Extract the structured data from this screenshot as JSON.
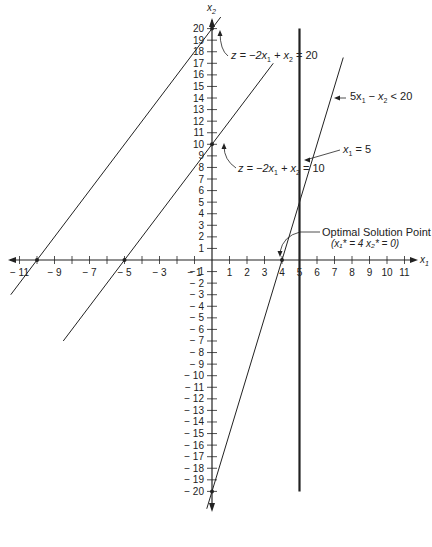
{
  "chart_data": {
    "type": "line",
    "title": "",
    "xlabel": "x1",
    "ylabel": "x2",
    "xlim": [
      -11.5,
      11.5
    ],
    "ylim": [
      -21,
      21
    ],
    "grid": false,
    "x_tick_labels": [
      "-11",
      "-9",
      "-7",
      "-5",
      "-3",
      "-1",
      "1",
      "2",
      "3",
      "4",
      "5",
      "6",
      "7",
      "8",
      "9",
      "10",
      "11"
    ],
    "y_tick_labels": [
      "20",
      "19",
      "18",
      "17",
      "16",
      "15",
      "14",
      "13",
      "12",
      "11",
      "10",
      "9",
      "8",
      "7",
      "6",
      "5",
      "4",
      "3",
      "2",
      "1",
      "-1",
      "-2",
      "-3",
      "-4",
      "-5",
      "-6",
      "-7",
      "-8",
      "-9",
      "-10",
      "-11",
      "-12",
      "-13",
      "-14",
      "-15",
      "-16",
      "-17",
      "-18",
      "-19",
      "-20"
    ],
    "series": [
      {
        "name": "z = -2x1 + x2 = 20",
        "equation": "x2 = 2x1 + 20",
        "x": [
          -11.5,
          0.5
        ],
        "y": [
          -3,
          21
        ],
        "marked_points": [
          [
            -10,
            0
          ],
          [
            0,
            20
          ]
        ]
      },
      {
        "name": "z = -2x1 + x2 = 10",
        "equation": "x2 = 2x1 + 10",
        "x": [
          -8.5,
          3.5
        ],
        "y": [
          -7,
          17
        ],
        "marked_points": [
          [
            -5,
            0
          ],
          [
            0,
            10
          ]
        ]
      },
      {
        "name": "5x1 - x2 < 20",
        "equation": "x2 = 5x1 - 20",
        "x": [
          -0.3,
          7.5
        ],
        "y": [
          -21.5,
          17.5
        ],
        "marked_points": [
          [
            4,
            0
          ],
          [
            0,
            -20
          ]
        ]
      },
      {
        "name": "x1 = 5",
        "equation": "x1 = 5",
        "x": [
          5,
          5
        ],
        "y": [
          20,
          -20
        ],
        "bold": true
      }
    ],
    "annotations": [
      {
        "text": "z = -2x1 + x2 = 20",
        "points_to": [
          0,
          20
        ]
      },
      {
        "text": "z = -2x1 + x2 = 10",
        "points_to": [
          0,
          10
        ]
      },
      {
        "text": "5x1 - x2 < 20",
        "points_to": [
          7,
          14
        ]
      },
      {
        "text": "x1 = 5",
        "points_to": [
          5,
          8.5
        ]
      },
      {
        "text": "Optimal Solution Point (x1* = 4 x2* = 0)",
        "points_to": [
          4,
          0
        ]
      }
    ]
  },
  "labels": {
    "x_axis": "x",
    "x_axis_sub": "1",
    "y_axis": "x",
    "y_axis_sub": "2",
    "z20": {
      "pre": "z  =  −2x",
      "s1": "1",
      "mid": "  +  x",
      "s2": "2",
      "post": "  =  20"
    },
    "z10": {
      "pre": "z  =  −2x",
      "s1": "1",
      "mid": "  +  x",
      "s2": "2",
      "post": "  =  10"
    },
    "constraint": {
      "pre": "5x",
      "s1": "1",
      "mid": "  −  x",
      "s2": "2",
      "post": "  <  20"
    },
    "x1eq5": {
      "pre": "x",
      "s1": "1",
      "post": "  =  5"
    },
    "optimal_title": "Optimal Solution Point",
    "optimal_detail": "(x₁*  =  4 x₂*  =  0)"
  }
}
